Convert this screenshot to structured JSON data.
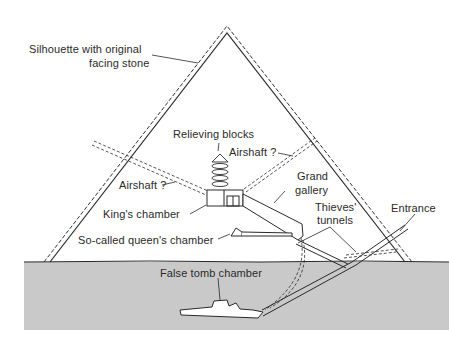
{
  "diagram": {
    "labels": {
      "silhouette_line1": "Silhouette with original",
      "silhouette_line2": "facing stone",
      "relieving_blocks": "Relieving blocks",
      "airshaft_right": "Airshaft ?",
      "airshaft_left": "Airshaft ?",
      "kings_chamber": "King's chamber",
      "grand_gallery_line1": "Grand",
      "grand_gallery_line2": "gallery",
      "thieves_line1": "Thieves'",
      "thieves_line2": "tunnels",
      "entrance": "Entrance",
      "queens_chamber": "So-called queen's chamber",
      "false_tomb": "False tomb chamber"
    },
    "colors": {
      "line": "#2a2a2a",
      "bedrock": "#c9c9c9",
      "background": "#ffffff"
    }
  }
}
